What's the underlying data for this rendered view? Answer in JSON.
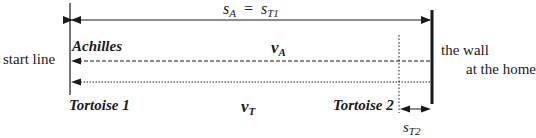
{
  "diagram": {
    "type": "motion-diagram",
    "top_distance": {
      "lhs_var": "s",
      "lhs_sub": "A",
      "equals": "=",
      "rhs_var": "s",
      "rhs_sub": "T1"
    },
    "labels": {
      "achilles": "Achilles",
      "start_line": "start line",
      "wall_line1": "the wall",
      "wall_line2": "at the home",
      "tortoise1": "Tortoise 1",
      "tortoise2": "Tortoise 2"
    },
    "velocities": {
      "achilles": {
        "var": "v",
        "sub": "A"
      },
      "tortoise": {
        "var": "v",
        "sub": "T"
      }
    },
    "gap_distance": {
      "var": "s",
      "sub": "T2"
    },
    "arrows": [
      {
        "name": "distance-arrow",
        "style": "solid",
        "from": "start line",
        "to": "wall",
        "direction": "both"
      },
      {
        "name": "achilles-velocity-arrow",
        "style": "dashed",
        "direction": "toward start line"
      },
      {
        "name": "tortoise-velocity-arrow",
        "style": "dotted",
        "direction": "toward start line"
      },
      {
        "name": "gap-arrow",
        "style": "solid",
        "from": "Tortoise 2",
        "to": "wall",
        "direction": "both"
      }
    ],
    "colors": {
      "ink": "#1a1a1a",
      "background": "#ffffff"
    }
  }
}
